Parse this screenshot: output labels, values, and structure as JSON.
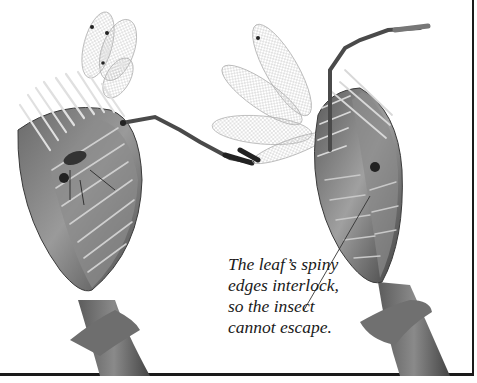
{
  "figure": {
    "caption_lines": [
      "The leaf’s spiny",
      "edges interlock,",
      "so the insect",
      "cannot escape."
    ],
    "colors": {
      "border": "#1a1a1a",
      "background": "#ffffff",
      "text": "#1a1a1a"
    }
  }
}
